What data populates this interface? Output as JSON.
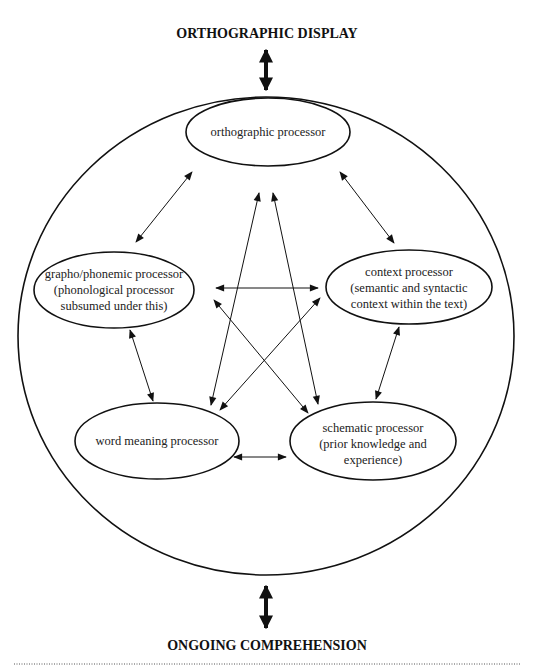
{
  "diagram": {
    "top_label": "ORTHOGRAPHIC DISPLAY",
    "bottom_label": "ONGOING COMPREHENSION",
    "processors": [
      {
        "id": "orthographic",
        "lines": [
          "orthographic processor"
        ]
      },
      {
        "id": "graphophonemic",
        "lines": [
          "grapho/phonemic processor",
          "(phonological processor",
          "subsumed under this)"
        ]
      },
      {
        "id": "context",
        "lines": [
          "context processor",
          "(semantic and syntactic",
          "context within the text)"
        ]
      },
      {
        "id": "word-meaning",
        "lines": [
          "word meaning processor"
        ]
      },
      {
        "id": "schematic",
        "lines": [
          "schematic processor",
          "(prior knowledge and",
          "experience)"
        ]
      }
    ],
    "connections": [
      {
        "from": "orthographic",
        "to": "graphophonemic",
        "bidirectional": true
      },
      {
        "from": "orthographic",
        "to": "context",
        "bidirectional": true
      },
      {
        "from": "orthographic",
        "to": "word-meaning",
        "bidirectional": true
      },
      {
        "from": "orthographic",
        "to": "schematic",
        "bidirectional": true
      },
      {
        "from": "graphophonemic",
        "to": "context",
        "bidirectional": true
      },
      {
        "from": "graphophonemic",
        "to": "word-meaning",
        "bidirectional": true
      },
      {
        "from": "graphophonemic",
        "to": "schematic",
        "bidirectional": true
      },
      {
        "from": "context",
        "to": "word-meaning",
        "bidirectional": true
      },
      {
        "from": "context",
        "to": "schematic",
        "bidirectional": true
      },
      {
        "from": "word-meaning",
        "to": "schematic",
        "bidirectional": true
      }
    ],
    "external_links": [
      {
        "from": "ORTHOGRAPHIC DISPLAY",
        "to": "system",
        "bidirectional": true
      },
      {
        "from": "system",
        "to": "ONGOING COMPREHENSION",
        "bidirectional": true
      }
    ]
  }
}
